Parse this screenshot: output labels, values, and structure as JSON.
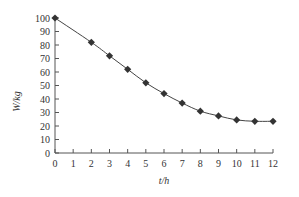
{
  "chart_data": {
    "type": "line",
    "title": "",
    "xlabel": "t/h",
    "ylabel": "W/kg",
    "xlim": [
      0,
      12
    ],
    "ylim": [
      0,
      100
    ],
    "xticks": [
      "0",
      "1",
      "2",
      "3",
      "4",
      "5",
      "6",
      "7",
      "8",
      "9",
      "10",
      "11",
      "12"
    ],
    "yticks": [
      "0",
      "10",
      "20",
      "30",
      "40",
      "50",
      "60",
      "70",
      "80",
      "90",
      "100"
    ],
    "grid": false,
    "legend": "none",
    "series": [
      {
        "name": "W",
        "marker": "diamond",
        "x": [
          0,
          2,
          3,
          4,
          5,
          6,
          7,
          8,
          9,
          10,
          11,
          12
        ],
        "y": [
          100,
          82,
          72,
          62,
          52,
          44,
          37,
          31,
          27.5,
          24.5,
          23.5,
          23.5
        ]
      }
    ]
  }
}
